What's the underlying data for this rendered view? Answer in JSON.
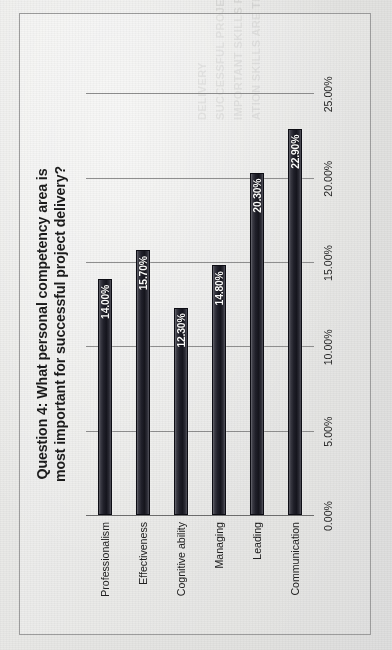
{
  "page": {
    "background_color": "#e6e6e4",
    "frame_color": "#9d9d9d"
  },
  "chart_data": {
    "type": "bar",
    "orientation": "vertical",
    "title_line1": "Question 4: What personal competency area is",
    "title_line2": "most important for successful project delivery?",
    "title": "Question 4: What personal competency area is most important for successful project delivery?",
    "xlabel": "",
    "ylabel": "",
    "categories": [
      "Professionalism",
      "Effectiveness",
      "Cognitive ability",
      "Managing",
      "Leading",
      "Communication"
    ],
    "values": [
      14.0,
      15.7,
      12.3,
      14.8,
      20.3,
      22.9
    ],
    "value_labels": [
      "14.00%",
      "15.70%",
      "12.30%",
      "14.80%",
      "20.30%",
      "22.90%"
    ],
    "tick_labels": [
      "0.00%",
      "5.00%",
      "10.00%",
      "15.00%",
      "20.00%",
      "25.00%"
    ],
    "tick_values": [
      0,
      5,
      10,
      15,
      20,
      25
    ],
    "ylim": [
      0,
      25
    ],
    "grid": true,
    "legend": false,
    "bar_color": "#15151d",
    "label_color": "#ffffff",
    "gridline_color": "#8f8f8f"
  },
  "bleed_text": [
    "ATION SKILLS ARE THE MOST",
    "IMPORTANT SKILLS FOR",
    "SUCCESSFUL PROJECT",
    "DELIVERY"
  ]
}
